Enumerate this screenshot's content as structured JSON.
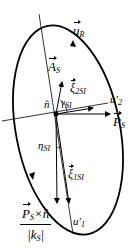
{
  "diagram": {
    "type": "polarization-ellipse",
    "labels": {
      "u_R": "u",
      "u_R_sub": "R",
      "A_S": "A",
      "A_S_sub": "S",
      "xi_2SI": "ξ",
      "xi_2SI_sub": "2SI",
      "gamma_SI": "γ",
      "gamma_SI_sub": "SI",
      "n_hat": "n̂",
      "u2_prime": "u′",
      "u2_prime_sub": "2",
      "P_S": "P",
      "P_S_sub": "S",
      "eta_SI": "η",
      "eta_SI_sub": "SI",
      "xi_1SI": "ξ",
      "xi_1SI_sub": "1SI",
      "u1_prime": "u′",
      "u1_prime_sub": "1",
      "fraction_numerator": "P",
      "fraction_numerator_sub": "S",
      "fraction_numerator_rest": "×n̂",
      "fraction_denominator": "|k",
      "fraction_denominator_sub": "S",
      "fraction_denominator_end": "|"
    },
    "colors": {
      "stroke": "#000000",
      "background": "#ffffff"
    }
  }
}
